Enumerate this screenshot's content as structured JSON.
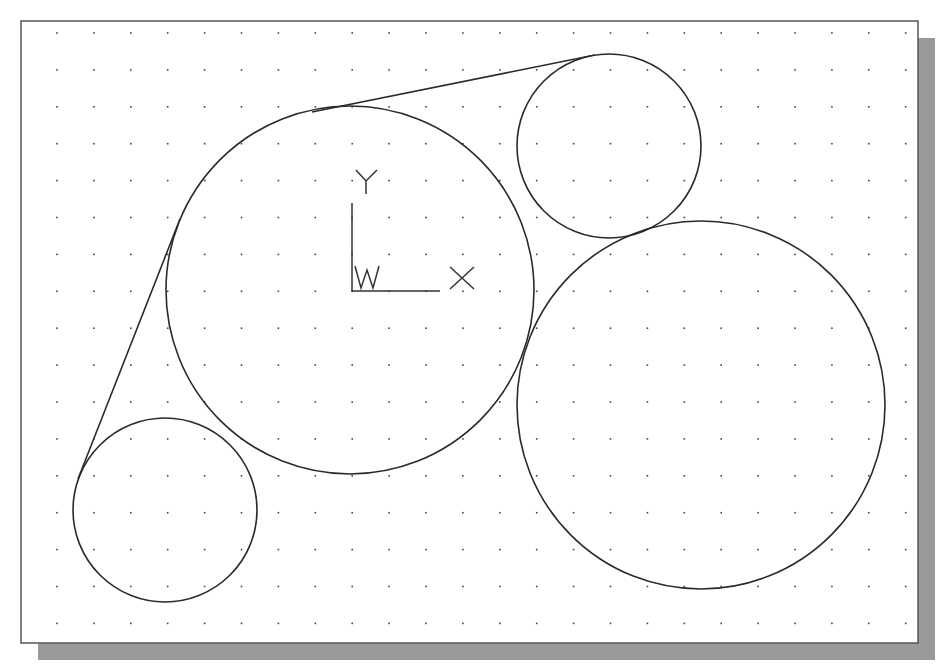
{
  "drawing": {
    "frame": {
      "x": 21,
      "y": 21,
      "width": 897,
      "height": 622
    },
    "shadow": {
      "offset_x": 17,
      "offset_y": 17,
      "color": "#9a9a9a"
    },
    "grid": {
      "origin_x": 57,
      "origin_y": 33,
      "step": 36.9,
      "columns": 24,
      "rows": 17
    },
    "circles": [
      {
        "name": "circle-center",
        "cx": 350,
        "cy": 290,
        "r": 184
      },
      {
        "name": "circle-top-right",
        "cx": 609,
        "cy": 146,
        "r": 92
      },
      {
        "name": "circle-bottom-left",
        "cx": 165,
        "cy": 510,
        "r": 92
      },
      {
        "name": "circle-right-large",
        "cx": 701,
        "cy": 405,
        "r": 184
      }
    ],
    "tangent_lines": [
      {
        "name": "tangent-line-top",
        "x1": 312,
        "y1": 112,
        "x2": 595,
        "y2": 55
      },
      {
        "name": "tangent-line-left",
        "x1": 180,
        "y1": 219,
        "x2": 78,
        "y2": 479
      }
    ],
    "ucs_icon": {
      "origin_x": 352,
      "origin_y": 291,
      "axis_length": 88,
      "x_label": "X",
      "y_label": "Y",
      "w_label": "W"
    }
  }
}
